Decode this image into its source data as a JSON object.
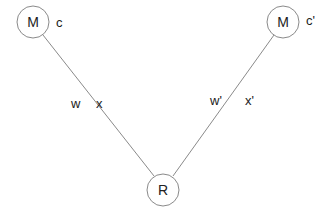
{
  "diagram": {
    "nodes": [
      {
        "id": "m-left",
        "label": "M",
        "annotation": "c"
      },
      {
        "id": "m-right",
        "label": "M",
        "annotation": "c'"
      },
      {
        "id": "r-bottom",
        "label": "R"
      }
    ],
    "edges": [
      {
        "from": "m-left",
        "to": "r-bottom",
        "labels": [
          "w",
          "x"
        ]
      },
      {
        "from": "m-right",
        "to": "r-bottom",
        "labels": [
          "w'",
          "x'"
        ]
      }
    ],
    "colors": {
      "stroke": "#8a8a8a",
      "text": "#222222",
      "background": "#ffffff"
    }
  }
}
